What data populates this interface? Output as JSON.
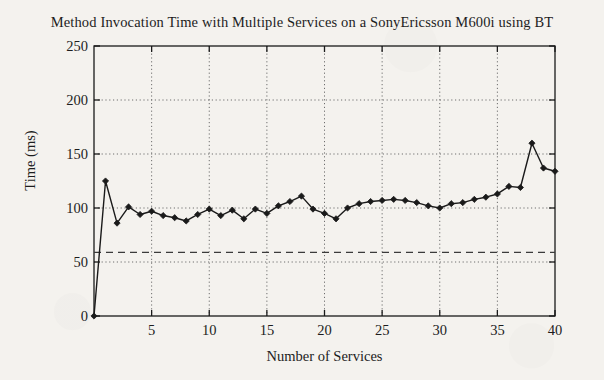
{
  "chart_data": {
    "type": "line",
    "title": "Method Invocation Time with Multiple Services on a SonyEricsson M600i using BT",
    "xlabel": "Number of Services",
    "ylabel": "Time (ms)",
    "xlim": [
      0,
      40
    ],
    "ylim": [
      0,
      250
    ],
    "xticks": [
      5,
      10,
      15,
      20,
      25,
      30,
      35,
      40
    ],
    "yticks": [
      0,
      50,
      100,
      150,
      200,
      250
    ],
    "grid": true,
    "grid_style": "dotted",
    "legend": null,
    "marker": "filled-diamond",
    "line_color": "#1a1a1a",
    "reference_line": {
      "value": 59,
      "style": "dashed",
      "color": "#3b3b3b"
    },
    "x": [
      0,
      1,
      2,
      3,
      4,
      5,
      6,
      7,
      8,
      9,
      10,
      11,
      12,
      13,
      14,
      15,
      16,
      17,
      18,
      19,
      20,
      21,
      22,
      23,
      24,
      25,
      26,
      27,
      28,
      29,
      30,
      31,
      32,
      33,
      34,
      35,
      36,
      37,
      38,
      39,
      40
    ],
    "values": [
      0,
      125,
      86,
      101,
      94,
      97,
      93,
      91,
      88,
      94,
      99,
      93,
      98,
      90,
      99,
      95,
      102,
      106,
      111,
      99,
      95,
      90,
      100,
      104,
      106,
      107,
      108,
      107,
      105,
      102,
      100,
      104,
      105,
      108,
      110,
      113,
      120,
      119,
      160,
      137,
      134
    ],
    "series": [
      {
        "name": "Method Invocation Time",
        "values": [
          0,
          125,
          86,
          101,
          94,
          97,
          93,
          91,
          88,
          94,
          99,
          93,
          98,
          90,
          99,
          95,
          102,
          106,
          111,
          99,
          95,
          90,
          100,
          104,
          106,
          107,
          108,
          107,
          105,
          102,
          100,
          104,
          105,
          108,
          110,
          113,
          120,
          119,
          160,
          137,
          134
        ]
      }
    ]
  }
}
